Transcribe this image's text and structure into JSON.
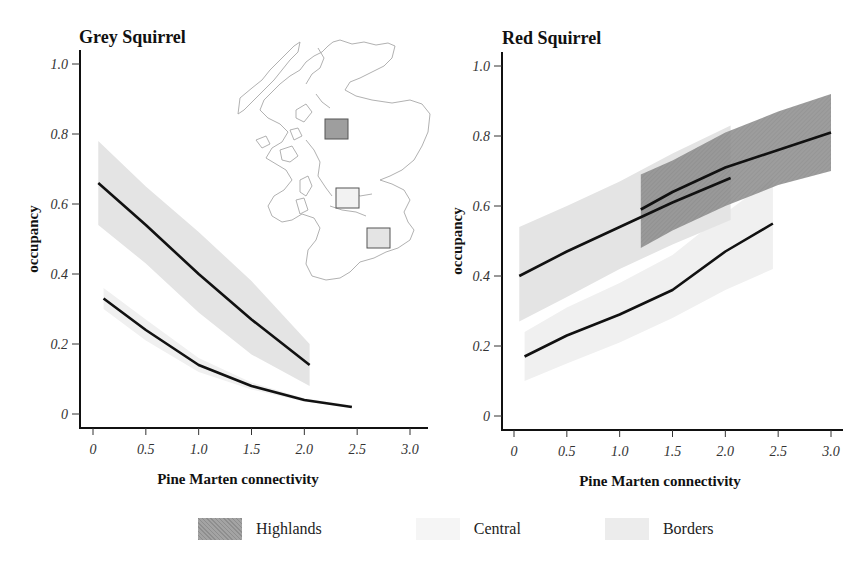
{
  "chart_data": [
    {
      "type": "line",
      "title": "Grey Squirrel",
      "xlabel": "Pine Marten connectivity",
      "ylabel": "occupancy",
      "xlim": [
        0,
        3.0
      ],
      "ylim": [
        0,
        1.0
      ],
      "x_ticks": [
        "0",
        "0.5",
        "1.0",
        "1.5",
        "2.0",
        "2.5",
        "3.0"
      ],
      "y_ticks": [
        "0",
        "0.2",
        "0.4",
        "0.6",
        "0.8",
        "1.0"
      ],
      "grid": false,
      "series": [
        {
          "name": "Central",
          "x": [
            0.05,
            0.5,
            1.0,
            1.5,
            2.05
          ],
          "values": [
            0.66,
            0.54,
            0.4,
            0.27,
            0.14
          ],
          "lower": [
            0.54,
            0.43,
            0.29,
            0.17,
            0.08
          ],
          "upper": [
            0.78,
            0.65,
            0.52,
            0.38,
            0.2
          ]
        },
        {
          "name": "Borders",
          "x": [
            0.1,
            0.5,
            1.0,
            1.5,
            2.0,
            2.45
          ],
          "values": [
            0.33,
            0.24,
            0.14,
            0.08,
            0.04,
            0.02
          ],
          "lower": [
            0.3,
            0.21,
            0.12,
            0.07,
            0.035,
            0.02
          ],
          "upper": [
            0.36,
            0.27,
            0.16,
            0.09,
            0.045,
            0.025
          ]
        }
      ]
    },
    {
      "type": "line",
      "title": "Red Squirrel",
      "xlabel": "Pine Marten connectivity",
      "ylabel": "occupancy",
      "xlim": [
        0,
        3.0
      ],
      "ylim": [
        0,
        1.0
      ],
      "x_ticks": [
        "0",
        "0.5",
        "1.0",
        "1.5",
        "2.0",
        "2.5",
        "3.0"
      ],
      "y_ticks": [
        "0",
        "0.2",
        "0.4",
        "0.6",
        "0.8",
        "1.0"
      ],
      "grid": false,
      "series": [
        {
          "name": "Central",
          "x": [
            0.05,
            0.5,
            1.0,
            1.5,
            2.05
          ],
          "values": [
            0.4,
            0.47,
            0.54,
            0.61,
            0.68
          ],
          "lower": [
            0.27,
            0.34,
            0.42,
            0.49,
            0.56
          ],
          "upper": [
            0.54,
            0.6,
            0.67,
            0.75,
            0.83
          ]
        },
        {
          "name": "Highlands",
          "x": [
            1.2,
            1.5,
            2.0,
            2.5,
            3.0
          ],
          "values": [
            0.59,
            0.64,
            0.71,
            0.76,
            0.81
          ],
          "lower": [
            0.48,
            0.53,
            0.6,
            0.66,
            0.7
          ],
          "upper": [
            0.69,
            0.73,
            0.81,
            0.87,
            0.92
          ]
        },
        {
          "name": "Borders",
          "x": [
            0.1,
            0.5,
            1.0,
            1.5,
            2.0,
            2.45
          ],
          "values": [
            0.17,
            0.23,
            0.29,
            0.36,
            0.47,
            0.55
          ],
          "lower": [
            0.1,
            0.15,
            0.21,
            0.28,
            0.36,
            0.42
          ],
          "upper": [
            0.24,
            0.31,
            0.38,
            0.46,
            0.58,
            0.68
          ]
        }
      ]
    }
  ],
  "legend": {
    "position": "bottom",
    "items": [
      {
        "label": "Highlands",
        "color": "#9a9a9a"
      },
      {
        "label": "Central",
        "color": "#f4f4f4"
      },
      {
        "label": "Borders",
        "color": "#ececec"
      }
    ]
  },
  "inset_map": {
    "label": "Scotland",
    "regions": [
      {
        "name": "Highlands",
        "color": "#9e9e9e"
      },
      {
        "name": "Central",
        "color": "#f2f2f2"
      },
      {
        "name": "Borders",
        "color": "#e6e6e6"
      }
    ]
  },
  "colors": {
    "line": "#111111",
    "highlands_band": "#8f8f8f",
    "central_band": "#e6e6e6",
    "borders_band": "#f1f1f1",
    "map_outline": "#a8a8a8"
  }
}
